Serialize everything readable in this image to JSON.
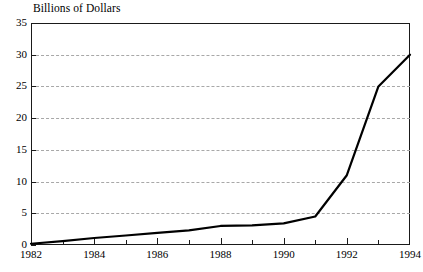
{
  "chart_data": {
    "type": "line",
    "title": "Billions of Dollars",
    "xlabel": "",
    "ylabel": "",
    "x": [
      1982,
      1983,
      1984,
      1985,
      1986,
      1987,
      1988,
      1989,
      1990,
      1991,
      1992,
      1993,
      1994
    ],
    "values": [
      0.2,
      0.6,
      1.1,
      1.5,
      1.9,
      2.3,
      3.0,
      3.1,
      3.4,
      4.5,
      11.0,
      25.0,
      30.0
    ],
    "series": [
      {
        "name": "Billions of Dollars",
        "values": [
          0.2,
          0.6,
          1.1,
          1.5,
          1.9,
          2.3,
          3.0,
          3.1,
          3.4,
          4.5,
          11.0,
          25.0,
          30.0
        ]
      }
    ],
    "xlim": [
      1982,
      1994
    ],
    "ylim": [
      0,
      35
    ],
    "y_ticks": [
      0,
      5,
      10,
      15,
      20,
      25,
      30,
      35
    ],
    "y_tick_labels": [
      "0",
      "5",
      "10",
      "15",
      "20",
      "25",
      "30",
      "35"
    ],
    "x_ticks": [
      1982,
      1983,
      1984,
      1985,
      1986,
      1987,
      1988,
      1989,
      1990,
      1991,
      1992,
      1993,
      1994
    ],
    "x_tick_labels_shown": [
      "1982",
      "1984",
      "1986",
      "1988",
      "1990",
      "1992",
      "1994"
    ],
    "grid": "horizontal-dashed",
    "legend": "none",
    "line_color": "#000000",
    "grid_color": "#a8a8a8",
    "axis_color": "#1a1a1a"
  }
}
